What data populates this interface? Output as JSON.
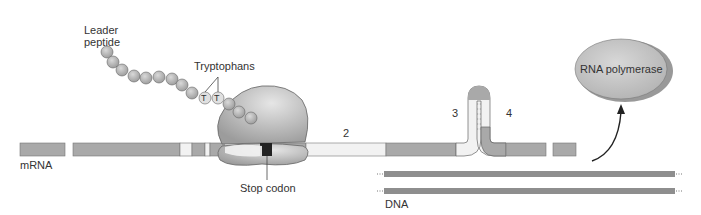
{
  "labels": {
    "leader_peptide": "Leader\npeptide",
    "tryptophans": "Tryptophans",
    "trp_residue": "T",
    "mrna": "mRNA",
    "stop_codon": "Stop codon",
    "region_2": "2",
    "region_3": "3",
    "region_4": "4",
    "dna": "DNA",
    "rna_polymerase": "RNA polymerase"
  },
  "colors": {
    "segment_gray": "#a9a9a9",
    "segment_light": "#f2f2f2",
    "stop_codon": "#222222",
    "ribosome": "#b8b8b8",
    "dna_strand": "#8e8e8e",
    "polymerase": "#c4c4c4",
    "outline": "#555555"
  }
}
